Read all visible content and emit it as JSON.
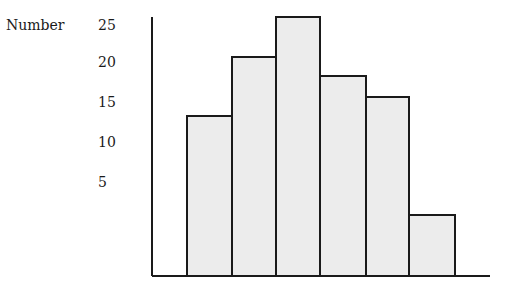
{
  "chart_data": {
    "type": "bar",
    "title": "",
    "xlabel": "",
    "ylabel": "Number",
    "categories": [
      "1",
      "2",
      "3",
      "4",
      "5",
      "6"
    ],
    "values": [
      14,
      21,
      26,
      19,
      16,
      2
    ],
    "y_tick_labels": [
      "25",
      "20",
      "15",
      "10",
      "5"
    ],
    "x_tick_labels": [],
    "grid": false,
    "legend": null,
    "bar_fill": "#ececec",
    "bar_edge": "#1a1a1a"
  },
  "geometry": {
    "baseline_y": 276,
    "axis_top_y": 17,
    "axis_x": 152,
    "axis_end_x": 490,
    "bars": [
      {
        "x0": 187,
        "x1": 232,
        "top": 116
      },
      {
        "x0": 232,
        "x1": 276,
        "top": 57
      },
      {
        "x0": 276,
        "x1": 320,
        "top": 17
      },
      {
        "x0": 320,
        "x1": 366,
        "top": 76
      },
      {
        "x0": 366,
        "x1": 409,
        "top": 97
      },
      {
        "x0": 409,
        "x1": 455,
        "top": 215
      }
    ],
    "tick_y": [
      27,
      64,
      104,
      144,
      184
    ]
  }
}
